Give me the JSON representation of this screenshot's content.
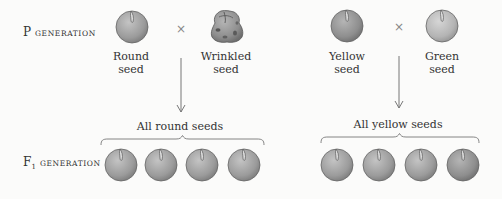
{
  "labels": {
    "p_generation": {
      "prefix": "P",
      "suffix": "generation"
    },
    "f1_generation": {
      "prefix": "F",
      "subscript": "1",
      "suffix": "generation"
    }
  },
  "crosses": [
    {
      "parent1": {
        "label_line1": "Round",
        "label_line2": "seed",
        "shape": "round",
        "color": "#9a9a9a"
      },
      "symbol": "×",
      "parent2": {
        "label_line1": "Wrinkled",
        "label_line2": "seed",
        "shape": "wrinkled",
        "color": "#8f8f8f"
      },
      "result": "All round seeds",
      "offspring_count": 4
    },
    {
      "parent1": {
        "label_line1": "Yellow",
        "label_line2": "seed",
        "shape": "round",
        "color": "#8e8e8e"
      },
      "symbol": "×",
      "parent2": {
        "label_line1": "Green",
        "label_line2": "seed",
        "shape": "round",
        "color": "#b0b0b0"
      },
      "result": "All yellow seeds",
      "offspring_count": 4
    }
  ]
}
